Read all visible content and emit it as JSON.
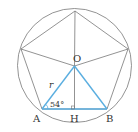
{
  "figure": {
    "labels": {
      "O": "O",
      "A": "A",
      "B": "B",
      "H": "H",
      "r": "r",
      "angle": "54°"
    },
    "colors": {
      "outline": "#777777",
      "highlight": "#5aaee0",
      "text": "#333333"
    },
    "circle": {
      "cx": 74.5,
      "cy": 65.5,
      "r": 57
    },
    "points": {
      "top": [
        75,
        11
      ],
      "left": [
        21,
        49
      ],
      "right": [
        128,
        49
      ],
      "A": [
        42,
        109
      ],
      "B": [
        107,
        109
      ],
      "O": [
        74.5,
        66
      ],
      "H": [
        74.5,
        109
      ]
    }
  }
}
